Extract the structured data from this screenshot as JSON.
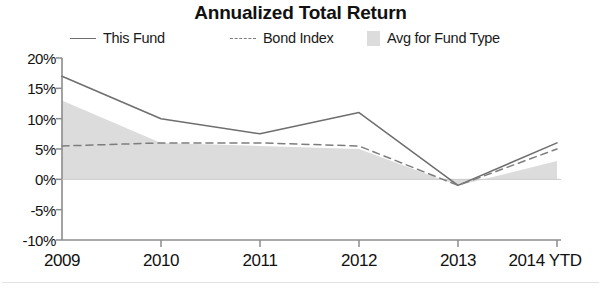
{
  "chart_data": {
    "type": "line",
    "title": "Annualized Total Return",
    "xlabel": "",
    "ylabel": "",
    "categories": [
      "2009",
      "2010",
      "2011",
      "2012",
      "2013",
      "2014 YTD"
    ],
    "ylim": [
      -10,
      20
    ],
    "yticks": [
      20,
      15,
      10,
      5,
      0,
      -5,
      -10
    ],
    "ytick_labels": [
      "20%",
      "15%",
      "10%",
      "5%",
      "0%",
      "-5%",
      "-10%"
    ],
    "grid": false,
    "legend_position": "top",
    "series": [
      {
        "name": "This Fund",
        "style": "solid-line",
        "color": "#6e6e6e",
        "values": [
          17.0,
          10.0,
          7.5,
          11.0,
          -1.0,
          6.0
        ]
      },
      {
        "name": "Bond Index",
        "style": "dashed-line",
        "color": "#7d7d7d",
        "values": [
          5.5,
          6.0,
          6.0,
          5.5,
          -1.0,
          5.0
        ]
      },
      {
        "name": "Avg for Fund Type",
        "style": "filled-area",
        "color": "#dcdcdc",
        "values": [
          13.0,
          6.0,
          5.5,
          5.0,
          -1.0,
          3.0
        ]
      }
    ]
  },
  "legend": {
    "items": [
      {
        "label": "This Fund",
        "swatch": "solid-line-swatch"
      },
      {
        "label": "Bond Index",
        "swatch": "dashed-line-swatch"
      },
      {
        "label": "Avg for Fund Type",
        "swatch": "area-fill-swatch"
      }
    ]
  },
  "colors": {
    "this_fund": "#6e6e6e",
    "bond_index": "#7d7d7d",
    "avg_fund_type": "#dcdcdc",
    "axis": "#8c8c8c",
    "text": "#111111"
  }
}
